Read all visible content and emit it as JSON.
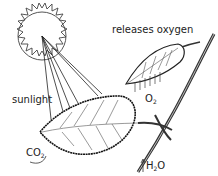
{
  "diagram": {
    "labels": {
      "releases_oxygen": "releases oxygen",
      "sunlight": "sunlight",
      "co2_main": "CO",
      "co2_sub": "2",
      "o2_main": "O",
      "o2_sub": "2",
      "h2o_h": "H",
      "h2o_sub": "2",
      "h2o_o": "O"
    },
    "elements": [
      "sun",
      "sun-rays",
      "large-leaf",
      "small-leaf",
      "stem",
      "oxygen-arrows",
      "co2-arrow",
      "water-arrow"
    ],
    "colors": {
      "line": "#222222",
      "vein": "#555555",
      "background": "#ffffff"
    }
  }
}
